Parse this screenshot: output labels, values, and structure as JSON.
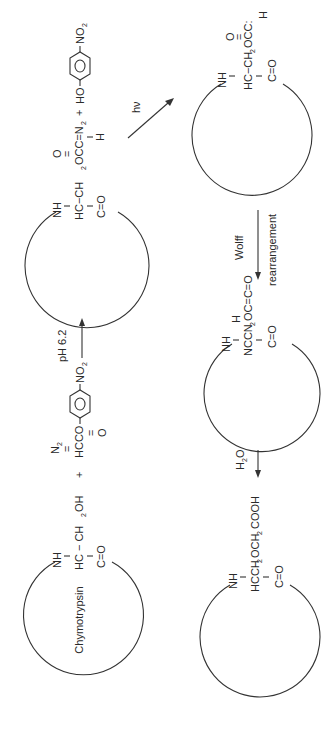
{
  "diagram": {
    "orientation": "rotated -90deg (reads bottom-to-top)",
    "colors": {
      "ink": "#2a2a2a",
      "background": "#ffffff"
    },
    "enzyme_label": "Chymotrypsin",
    "step1": {
      "enzyme": {
        "nh": "NH",
        "residue": "HC − CH",
        "sub2": "2",
        "oh": "OH",
        "co": "C=O"
      },
      "plus": "+",
      "reagent": {
        "n2": "N",
        "n2sub": "2",
        "eq": "=",
        "main": "HCCO",
        "o": "O",
        "nitro": "NO",
        "nitrosub": "2"
      },
      "arrow_label": "pH 6.2"
    },
    "intermediate": {
      "nh": "NH",
      "o_top": "O",
      "residue": "HC−CH",
      "sub2": "2",
      "ester": "OCC=N",
      "n2sub": "2",
      "h": "H",
      "co": "C=O",
      "plus": "+",
      "ho": "HO",
      "nitro": "NO",
      "nitrosub": "2",
      "arrow_label": "hν"
    },
    "carbene": {
      "nh": "NH",
      "o_top": "O",
      "residue": "HC−CH",
      "sub2": "2",
      "ester": "OCC:",
      "h": "H",
      "co": "C=O",
      "arrow_label_1": "Wolff",
      "arrow_label_2": "rearrangement"
    },
    "ketene": {
      "nh": "NH",
      "h": "H",
      "residue": "NCCN",
      "sub2": "2",
      "tail": "OC=C=O",
      "co": "C=O",
      "arrow_label": "H",
      "arrow_sub": "2",
      "arrow_label_o": "O"
    },
    "product": {
      "nh": "NH",
      "residue": "HCCH",
      "sub2a": "2",
      "mid": "OCH",
      "sub2b": "2",
      "tail": "COOH",
      "co": "C=O"
    }
  }
}
